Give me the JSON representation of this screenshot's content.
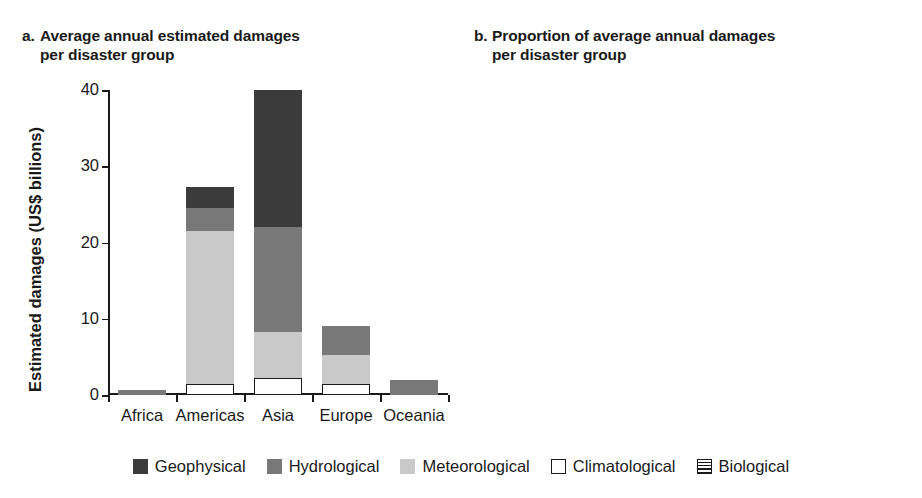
{
  "figure": {
    "legend": {
      "items": [
        {
          "label": "Geophysical",
          "key": "geophysical",
          "color": "#3b3b3b",
          "swatch": "solid-dark-square-icon"
        },
        {
          "label": "Hydrological",
          "key": "hydrological",
          "color": "#787878",
          "swatch": "solid-mid-gray-square-icon"
        },
        {
          "label": "Meteorological",
          "key": "meteorological",
          "color": "#c9c9c9",
          "swatch": "solid-light-gray-square-icon"
        },
        {
          "label": "Climatological",
          "key": "climatological",
          "color": "#ffffff",
          "swatch": "outlined-white-square-icon"
        },
        {
          "label": "Biological",
          "key": "biological",
          "color": "#ffffff",
          "swatch": "horizontal-striped-square-icon"
        }
      ]
    }
  },
  "chart_data": [
    {
      "type": "bar",
      "panel": "a",
      "panel_label": "a.",
      "title": "Average annual estimated damages per disaster group",
      "title_line1": "Average annual estimated damages",
      "title_line2": "per disaster group",
      "xlabel": "",
      "ylabel": "Estimated damages (US$ billions)",
      "ylim": [
        0,
        40
      ],
      "yticks": [
        0,
        10,
        20,
        30,
        40
      ],
      "ytick_labels": [
        "0",
        "10",
        "20",
        "30",
        "40"
      ],
      "grid": false,
      "stacked": true,
      "stack_order_bottom_up": [
        "climatological",
        "meteorological",
        "hydrological",
        "geophysical",
        "biological"
      ],
      "categories": [
        "Africa",
        "Americas",
        "Asia",
        "Europe",
        "Oceania"
      ],
      "series": [
        {
          "name": "Climatological",
          "key": "climatological",
          "values": [
            0.0,
            1.4,
            2.2,
            1.4,
            0.0
          ]
        },
        {
          "name": "Meteorological",
          "key": "meteorological",
          "values": [
            0.0,
            20.1,
            6.1,
            3.9,
            0.0
          ]
        },
        {
          "name": "Hydrological",
          "key": "hydrological",
          "values": [
            0.7,
            3.0,
            13.7,
            3.7,
            2.0
          ]
        },
        {
          "name": "Geophysical",
          "key": "geophysical",
          "values": [
            0.0,
            2.8,
            18.0,
            0.0,
            0.0
          ]
        },
        {
          "name": "Biological",
          "key": "biological",
          "values": [
            0.0,
            0.0,
            0.0,
            0.0,
            0.0
          ]
        }
      ],
      "totals": [
        0.7,
        27.3,
        40.0,
        9.0,
        2.0
      ]
    },
    {
      "type": "bar",
      "panel": "b",
      "panel_label": "b.",
      "title": "Proportion of average annual damages per disaster group",
      "title_line1": "Proportion of average annual damages",
      "title_line2": "per disaster group",
      "xlabel": "",
      "ylabel": "Proportion",
      "ylim": [
        0,
        1.0
      ],
      "yticks": [
        0,
        0.2,
        0.4,
        0.6,
        0.8,
        1.0
      ],
      "ytick_labels": [
        "0",
        "0.2",
        "0.4",
        "0.6",
        "0.8",
        "1.0"
      ],
      "grid": false,
      "stacked": true,
      "stack_order_bottom_up": [
        "climatological",
        "meteorological",
        "hydrological",
        "geophysical",
        "biological"
      ],
      "categories": [
        "Africa",
        "Americas",
        "Asia",
        "Europe",
        "Oceania"
      ],
      "series": [
        {
          "name": "Climatological",
          "key": "climatological",
          "values": [
            0.165,
            0.06,
            0.058,
            0.185,
            0.105
          ]
        },
        {
          "name": "Meteorological",
          "key": "meteorological",
          "values": [
            0.09,
            0.72,
            0.147,
            0.345,
            0.23
          ]
        },
        {
          "name": "Hydrological",
          "key": "hydrological",
          "values": [
            0.3,
            0.105,
            0.425,
            0.4,
            0.22
          ]
        },
        {
          "name": "Geophysical",
          "key": "geophysical",
          "values": [
            0.445,
            0.115,
            0.37,
            0.07,
            0.445
          ]
        },
        {
          "name": "Biological",
          "key": "biological",
          "values": [
            0.0,
            0.0,
            0.0,
            0.0,
            0.0
          ]
        }
      ],
      "totals": [
        1.0,
        1.0,
        1.0,
        1.0,
        1.0
      ]
    }
  ]
}
